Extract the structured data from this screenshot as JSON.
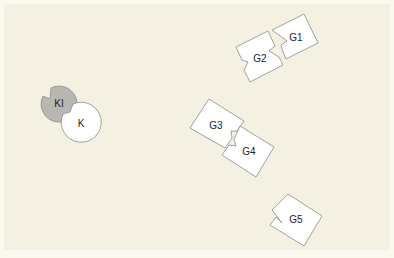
{
  "diagram": {
    "background": "#f4f1e3",
    "outline_color": "#8a8a8a",
    "shapes": [
      {
        "id": "KI",
        "label": "KI",
        "type": "notched-circle",
        "fill": "#b9b7b2"
      },
      {
        "id": "K",
        "label": "K",
        "type": "notched-circle",
        "fill": "#ffffff"
      },
      {
        "id": "G1",
        "label": "G1",
        "type": "notched-tile",
        "fill": "#ffffff"
      },
      {
        "id": "G2",
        "label": "G2",
        "type": "notched-tile",
        "fill": "#ffffff"
      },
      {
        "id": "G3",
        "label": "G3",
        "type": "notched-tile",
        "fill": "#ffffff"
      },
      {
        "id": "G4",
        "label": "G4",
        "type": "notched-tile",
        "fill": "#ffffff"
      },
      {
        "id": "G5",
        "label": "G5",
        "type": "notched-tile",
        "fill": "#ffffff"
      }
    ]
  }
}
